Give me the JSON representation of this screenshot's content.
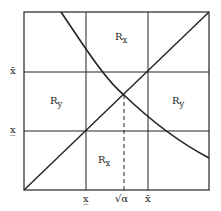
{
  "diagram": {
    "regions": [
      {
        "label": "R",
        "sub": "x",
        "pos": "top-middle"
      },
      {
        "label": "R",
        "sub": "y",
        "pos": "middle-left"
      },
      {
        "label": "R",
        "sub": "y",
        "pos": "middle-right"
      },
      {
        "label": "R",
        "sub": "x",
        "pos": "bottom-middle"
      }
    ],
    "y_axis_labels": [
      "x̄",
      "x̲"
    ],
    "x_axis_labels": [
      "x̲",
      "√α",
      "x̄"
    ]
  }
}
